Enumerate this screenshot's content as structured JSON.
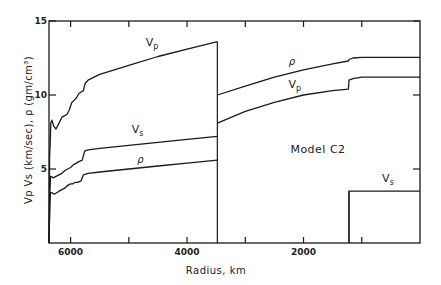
{
  "chart_data": {
    "type": "line",
    "title": "Model C2",
    "xlabel": "Radius,  km",
    "ylabel": "Vp  Vs  (km/sec),  ρ (gm/cm³)",
    "xlim": [
      6371,
      0
    ],
    "ylim": [
      0,
      15
    ],
    "x_ticks": [
      6000,
      5000,
      4000,
      3000,
      2000,
      1000
    ],
    "x_tick_labels": [
      "6000",
      "",
      "4000",
      "",
      "2000",
      ""
    ],
    "y_ticks": [
      5,
      10,
      15
    ],
    "y_tick_labels": [
      "5",
      "10",
      "15"
    ],
    "grid": false,
    "legend": "inline curve labels",
    "annotation": "Model C2",
    "series": [
      {
        "name": "Vp",
        "label": "Vp",
        "x": [
          6371,
          6360,
          6350,
          6340,
          6320,
          6290,
          6250,
          6200,
          6150,
          6100,
          6060,
          6020,
          5980,
          5950,
          5900,
          5860,
          5820,
          5780,
          5750,
          5700,
          5500,
          5000,
          4500,
          4000,
          3480
        ],
        "y": [
          0,
          5.8,
          6.8,
          8.1,
          8.3,
          7.9,
          7.7,
          8.1,
          8.5,
          8.6,
          8.7,
          9.0,
          9.5,
          9.6,
          9.8,
          10.1,
          10.2,
          10.3,
          10.8,
          11.0,
          11.4,
          12.0,
          12.6,
          13.1,
          13.6
        ]
      },
      {
        "name": "Vs",
        "label": "Vs",
        "x": [
          6371,
          6355,
          6345,
          6330,
          6300,
          6250,
          6200,
          6150,
          6100,
          6050,
          6000,
          5950,
          5900,
          5860,
          5800,
          5760,
          5700,
          5500,
          5000,
          4500,
          4000,
          3480
        ],
        "y": [
          0,
          3.4,
          4.5,
          4.5,
          4.4,
          4.5,
          4.6,
          4.7,
          4.9,
          5.0,
          5.1,
          5.3,
          5.4,
          5.5,
          5.6,
          6.2,
          6.3,
          6.4,
          6.6,
          6.8,
          7.0,
          7.2
        ]
      },
      {
        "name": "rho",
        "label": "ρ",
        "x": [
          6371,
          6355,
          6345,
          6320,
          6280,
          6240,
          6200,
          6150,
          6100,
          6050,
          6000,
          5960,
          5920,
          5880,
          5820,
          5780,
          5700,
          5500,
          5000,
          4500,
          4000,
          3480
        ],
        "y": [
          0,
          2.7,
          3.4,
          3.4,
          3.3,
          3.4,
          3.5,
          3.6,
          3.7,
          3.9,
          4.0,
          4.0,
          4.1,
          4.1,
          4.2,
          4.6,
          4.7,
          4.8,
          5.0,
          5.2,
          5.4,
          5.6
        ]
      },
      {
        "name": "rho_core",
        "label": "ρ",
        "x": [
          3480,
          3000,
          2500,
          2000,
          1500,
          1230,
          1220,
          1150,
          1000,
          500,
          0
        ],
        "y": [
          10.0,
          10.6,
          11.2,
          11.7,
          12.1,
          12.3,
          12.4,
          12.5,
          12.55,
          12.55,
          12.55
        ]
      },
      {
        "name": "Vp_core",
        "label": "Vp",
        "x": [
          3480,
          3000,
          2500,
          2000,
          1500,
          1230,
          1220,
          1150,
          1000,
          500,
          0
        ],
        "y": [
          8.1,
          8.9,
          9.5,
          10.0,
          10.3,
          10.4,
          11.0,
          11.1,
          11.2,
          11.2,
          11.2
        ]
      },
      {
        "name": "Vs_inner_core",
        "label": "Vs",
        "x": [
          1220,
          1220,
          0
        ],
        "y": [
          0,
          3.5,
          3.5
        ]
      }
    ],
    "boundaries": [
      {
        "name": "core-mantle boundary",
        "x": 3480,
        "y_from": 0,
        "y_to": 13.6
      },
      {
        "name": "inner-core boundary",
        "x": 1220,
        "y_from": 0,
        "y_to": 3.5
      }
    ],
    "curve_labels": [
      {
        "text": "V",
        "sub": "p",
        "x": 4600,
        "y": 13.3
      },
      {
        "text": "V",
        "sub": "s",
        "x": 4850,
        "y": 7.4
      },
      {
        "text": "ρ",
        "sub": "",
        "x": 4800,
        "y": 5.4
      },
      {
        "text": "ρ",
        "sub": "",
        "x": 2200,
        "y": 12.0
      },
      {
        "text": "V",
        "sub": "p",
        "x": 2150,
        "y": 10.5
      },
      {
        "text": "V",
        "sub": "s",
        "x": 550,
        "y": 4.1
      }
    ]
  },
  "labels": {
    "x_axis_title": "Radius,  km",
    "y_axis_title": "Vp  Vs  (km/sec),  ρ (gm/cm³)",
    "model_label": "Model C2"
  }
}
